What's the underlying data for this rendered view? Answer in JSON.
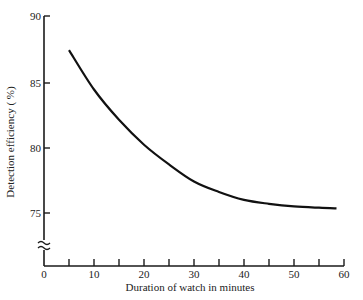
{
  "chart_data": {
    "type": "line",
    "title": "",
    "xlabel": "Duration of watch in minutes",
    "ylabel": "Detection efficiency ( %)",
    "xlim": [
      0,
      60
    ],
    "ylim": [
      75,
      90
    ],
    "y_axis_break": true,
    "grid": false,
    "legend": null,
    "x_ticks": [
      0,
      10,
      20,
      30,
      40,
      50,
      60
    ],
    "x_minor_ticks": [
      5,
      15,
      25,
      35,
      45,
      55
    ],
    "y_ticks": [
      75,
      80,
      85,
      90
    ],
    "series": [
      {
        "name": "Detection efficiency",
        "x": [
          5,
          10,
          15,
          20,
          25,
          30,
          35,
          40,
          45,
          50,
          55,
          58.5
        ],
        "y": [
          87.4,
          84.4,
          82.1,
          80.2,
          78.7,
          77.4,
          76.6,
          76.0,
          75.7,
          75.5,
          75.4,
          75.35
        ]
      }
    ]
  },
  "labels": {
    "x_title": "Duration of watch in minutes",
    "y_title": "Detection efficiency ( %)",
    "x_tick_0": "0",
    "x_tick_10": "10",
    "x_tick_20": "20",
    "x_tick_30": "30",
    "x_tick_40": "40",
    "x_tick_50": "50",
    "x_tick_60": "60",
    "y_tick_75": "75",
    "y_tick_80": "80",
    "y_tick_85": "85",
    "y_tick_90": "90",
    "axis_break": "≈"
  },
  "colors": {
    "line": "#111111",
    "axis": "#1a1a1a",
    "background": "#ffffff"
  }
}
